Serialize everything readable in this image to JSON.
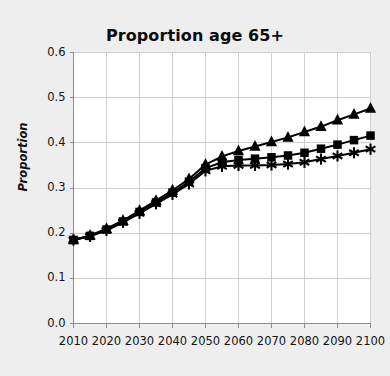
{
  "chart_data": {
    "type": "line",
    "title": "Proportion age 65+",
    "xlabel": "",
    "ylabel": "Proportion",
    "x": [
      2010,
      2015,
      2020,
      2025,
      2030,
      2035,
      2040,
      2045,
      2050,
      2055,
      2060,
      2065,
      2070,
      2075,
      2080,
      2085,
      2090,
      2095,
      2100
    ],
    "xtick_labels": [
      "2010",
      "2020",
      "2030",
      "2040",
      "2050",
      "2060",
      "2070",
      "2080",
      "2090",
      "2100"
    ],
    "xticks": [
      2010,
      2020,
      2030,
      2040,
      2050,
      2060,
      2070,
      2080,
      2090,
      2100
    ],
    "ytick_labels": [
      "0.0",
      "0.1",
      "0.2",
      "0.3",
      "0.4",
      "0.5",
      "0.6"
    ],
    "yticks": [
      0.0,
      0.1,
      0.2,
      0.3,
      0.4,
      0.5,
      0.6
    ],
    "xlim": [
      2010,
      2100
    ],
    "ylim": [
      0.0,
      0.6
    ],
    "grid": true,
    "legend": "none",
    "line_color": "#000000",
    "grid_color": "#cfcfcf",
    "plot_background": "#ffffff",
    "figure_background": "#eeeeee",
    "series": [
      {
        "name": "high",
        "marker": "triangle",
        "values": [
          0.185,
          0.195,
          0.21,
          0.228,
          0.25,
          0.272,
          0.295,
          0.32,
          0.352,
          0.37,
          0.382,
          0.392,
          0.402,
          0.412,
          0.424,
          0.436,
          0.45,
          0.463,
          0.476
        ]
      },
      {
        "name": "medium",
        "marker": "square",
        "values": [
          0.185,
          0.194,
          0.208,
          0.226,
          0.247,
          0.268,
          0.29,
          0.314,
          0.344,
          0.357,
          0.362,
          0.365,
          0.368,
          0.372,
          0.378,
          0.387,
          0.396,
          0.406,
          0.416
        ]
      },
      {
        "name": "low",
        "marker": "asterisk",
        "values": [
          0.185,
          0.193,
          0.206,
          0.224,
          0.244,
          0.265,
          0.286,
          0.309,
          0.338,
          0.348,
          0.35,
          0.35,
          0.351,
          0.353,
          0.357,
          0.364,
          0.371,
          0.378,
          0.386
        ]
      }
    ]
  }
}
